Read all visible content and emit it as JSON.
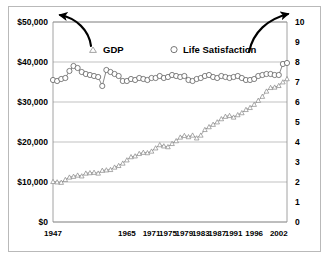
{
  "chart_data": {
    "type": "line",
    "title": "",
    "subtitle": "",
    "xlabel": "",
    "ylabel": "",
    "grid": true,
    "legend_position": "top-inside",
    "x_tick_labels": [
      "1947",
      "1965",
      "1971",
      "1975",
      "1979",
      "1983",
      "1987",
      "1991",
      "1996",
      "2002"
    ],
    "x_tick_years": [
      1947,
      1965,
      1971,
      1975,
      1979,
      1983,
      1987,
      1991,
      1996,
      2002
    ],
    "xlim": [
      1947,
      2004
    ],
    "left_axis": {
      "label": "",
      "ylim": [
        0,
        50000
      ],
      "tick_labels": [
        "$0",
        "$10,000",
        "$20,000",
        "$30,000",
        "$40,000",
        "$50,000"
      ],
      "tick_values": [
        0,
        10000,
        20000,
        30000,
        40000,
        50000
      ]
    },
    "right_axis": {
      "label": "",
      "ylim": [
        0,
        10
      ],
      "tick_labels": [
        "0",
        "1",
        "2",
        "3",
        "4",
        "5",
        "6",
        "7",
        "8",
        "9",
        "10"
      ],
      "tick_values": [
        0,
        1,
        2,
        3,
        4,
        5,
        6,
        7,
        8,
        9,
        10
      ]
    },
    "annotations": [
      {
        "name": "arrow-to-left-axis",
        "text": "",
        "from": "gdp-legend",
        "to": "left-axis"
      },
      {
        "name": "arrow-to-right-axis",
        "text": "",
        "from": "life-satisfaction-legend",
        "to": "right-axis"
      }
    ],
    "series": [
      {
        "name": "GDP",
        "axis": "left",
        "marker": "triangle-open",
        "color": "#7f7f7f",
        "x": [
          1947,
          1948,
          1949,
          1950,
          1951,
          1952,
          1953,
          1954,
          1955,
          1956,
          1957,
          1958,
          1959,
          1960,
          1961,
          1962,
          1963,
          1964,
          1965,
          1966,
          1967,
          1968,
          1969,
          1970,
          1971,
          1972,
          1973,
          1974,
          1975,
          1976,
          1977,
          1978,
          1979,
          1980,
          1981,
          1982,
          1983,
          1984,
          1985,
          1986,
          1987,
          1988,
          1989,
          1990,
          1991,
          1992,
          1993,
          1994,
          1995,
          1996,
          1997,
          1998,
          1999,
          2000,
          2001,
          2002,
          2003,
          2004
        ],
        "values": [
          10100,
          10000,
          9900,
          10600,
          11200,
          11400,
          11700,
          11500,
          12200,
          12300,
          12400,
          12200,
          12900,
          13000,
          13100,
          13700,
          14100,
          14700,
          15500,
          16300,
          16500,
          17100,
          17400,
          17300,
          17700,
          18500,
          19300,
          19000,
          18800,
          19600,
          20300,
          21200,
          21600,
          21300,
          21700,
          21000,
          21700,
          23100,
          23800,
          24400,
          25000,
          25800,
          26400,
          26600,
          26200,
          26800,
          27300,
          28100,
          28600,
          29400,
          30400,
          31400,
          32700,
          33600,
          33700,
          34100,
          35000,
          35800
        ],
        "first_value": 10100,
        "last_value": 35800
      },
      {
        "name": "Life Satisfaction",
        "axis": "right",
        "marker": "circle-open",
        "color": "#555555",
        "x": [
          1947,
          1948,
          1949,
          1950,
          1951,
          1952,
          1953,
          1954,
          1955,
          1956,
          1957,
          1958,
          1959,
          1960,
          1961,
          1962,
          1963,
          1964,
          1965,
          1966,
          1967,
          1968,
          1969,
          1970,
          1971,
          1972,
          1973,
          1974,
          1975,
          1976,
          1977,
          1978,
          1979,
          1980,
          1981,
          1982,
          1983,
          1984,
          1985,
          1986,
          1987,
          1988,
          1989,
          1990,
          1991,
          1992,
          1993,
          1994,
          1995,
          1996,
          1997,
          1998,
          1999,
          2000,
          2001,
          2002,
          2003,
          2004
        ],
        "values": [
          7.1,
          7.05,
          7.15,
          7.2,
          7.55,
          7.8,
          7.7,
          7.5,
          7.4,
          7.35,
          7.3,
          7.25,
          6.8,
          7.6,
          7.5,
          7.4,
          7.3,
          7.05,
          7.05,
          7.15,
          7.1,
          7.2,
          7.15,
          7.1,
          7.2,
          7.2,
          7.3,
          7.2,
          7.25,
          7.35,
          7.3,
          7.25,
          7.3,
          7.1,
          7.05,
          7.15,
          7.2,
          7.3,
          7.35,
          7.25,
          7.2,
          7.3,
          7.25,
          7.2,
          7.25,
          7.3,
          7.2,
          7.1,
          7.1,
          7.15,
          7.3,
          7.35,
          7.4,
          7.4,
          7.35,
          7.35,
          7.9,
          7.95
        ],
        "first_value": 7.1,
        "last_value": 7.95
      }
    ]
  },
  "legend": {
    "items": [
      {
        "label": "GDP",
        "marker": "triangle-open"
      },
      {
        "label": "Life Satisfaction",
        "marker": "circle-open"
      }
    ]
  },
  "colors": {
    "frame": "#b9b9b9",
    "axis": "#8c8c8c",
    "grid": "#a6a6a6",
    "gdp_line": "#7f7f7f",
    "life_line": "#555555",
    "arrow": "#000000",
    "text": "#000000",
    "background": "#ffffff"
  }
}
